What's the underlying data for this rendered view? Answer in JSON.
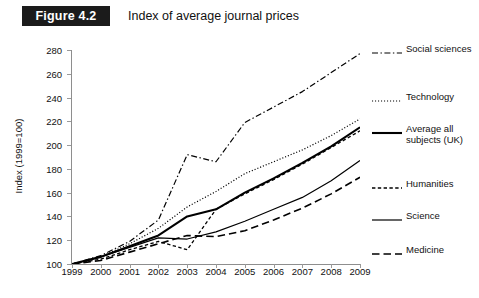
{
  "header": {
    "badge": "Figure 4.2",
    "title": "Index of average journal prices"
  },
  "chart_data": {
    "type": "line",
    "title": "Index of average journal prices",
    "xlabel": "",
    "ylabel": "Index (1999=100)",
    "xlim": [
      1999,
      2009
    ],
    "ylim": [
      100,
      280
    ],
    "ytick_step": 20,
    "grid": false,
    "legend_position": "right",
    "categories": [
      "1999",
      "2000",
      "2001",
      "2002",
      "2003",
      "2004",
      "2005",
      "2006",
      "2007",
      "2008",
      "2009"
    ],
    "x": [
      1999,
      2000,
      2001,
      2002,
      2003,
      2004,
      2005,
      2006,
      2007,
      2008,
      2009
    ],
    "yticks": [
      100,
      120,
      140,
      160,
      180,
      200,
      220,
      240,
      260,
      280
    ],
    "series": [
      {
        "name": "Social sciences",
        "style": "dash-dot",
        "values": [
          100,
          107,
          119,
          137,
          192,
          186,
          219,
          232,
          245,
          261,
          277
        ]
      },
      {
        "name": "Technology",
        "style": "dotted",
        "values": [
          100,
          106,
          117,
          130,
          148,
          161,
          176,
          186,
          196,
          208,
          222
        ]
      },
      {
        "name": "Average all subjects (UK)",
        "style": "solid-thick",
        "values": [
          100,
          106,
          115,
          124,
          140,
          146,
          160,
          172,
          185,
          199,
          215
        ]
      },
      {
        "name": "Humanities",
        "style": "dashed-short",
        "values": [
          100,
          104,
          112,
          119,
          112,
          146,
          159,
          171,
          184,
          198,
          212
        ]
      },
      {
        "name": "Science",
        "style": "solid-thin",
        "values": [
          100,
          106,
          114,
          122,
          121,
          127,
          136,
          146,
          156,
          170,
          187
        ]
      },
      {
        "name": "Medicine",
        "style": "dashed-long",
        "values": [
          100,
          103,
          110,
          117,
          124,
          123,
          128,
          137,
          147,
          159,
          173
        ]
      }
    ]
  },
  "legend": {
    "items": [
      {
        "label": "Social sciences",
        "style": "dash-dot"
      },
      {
        "label": "Technology",
        "style": "dotted"
      },
      {
        "label": "Average all subjects (UK)",
        "style": "solid-thick"
      },
      {
        "label": "Humanities",
        "style": "dashed-short"
      },
      {
        "label": "Science",
        "style": "solid-thin"
      },
      {
        "label": "Medicine",
        "style": "dashed-long"
      }
    ]
  }
}
